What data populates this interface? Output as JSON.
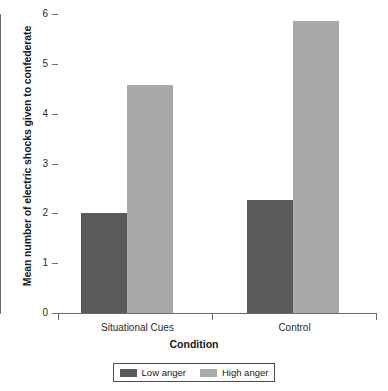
{
  "chart_data": {
    "type": "bar",
    "title": "",
    "xlabel": "Condition",
    "ylabel": "Mean number of electric shocks given to confederate",
    "categories": [
      "Situational Cues",
      "Control"
    ],
    "series": [
      {
        "name": "Low anger",
        "values": [
          2.0,
          2.27
        ],
        "color": "#5a5a5a"
      },
      {
        "name": "High anger",
        "values": [
          4.58,
          5.85
        ],
        "color": "#a9a9a9"
      }
    ],
    "ylim": [
      0,
      6
    ],
    "yticks": [
      0,
      1,
      2,
      3,
      4,
      5,
      6
    ],
    "ytick_labels": [
      "0",
      "1",
      "2",
      "3",
      "4",
      "5",
      "6"
    ],
    "grid": false,
    "legend_position": "bottom",
    "legend_entries": [
      "Low anger",
      "High anger"
    ],
    "axis_color": "#6b6b6b",
    "background": "#ffffff"
  },
  "axis": {
    "y_title": "Mean number of electric shocks given to confederate",
    "x_title": "Condition",
    "tick_0": "0",
    "tick_1": "1",
    "tick_2": "2",
    "tick_3": "3",
    "tick_4": "4",
    "tick_5": "5",
    "tick_6": "6"
  },
  "categories": {
    "cat_0": "Situational Cues",
    "cat_1": "Control"
  },
  "legend": {
    "entry_0": "Low anger",
    "entry_1": "High anger"
  }
}
